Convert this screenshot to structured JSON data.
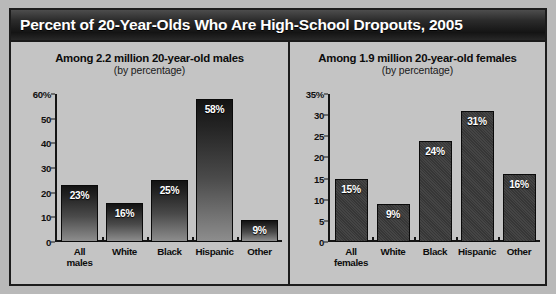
{
  "title": "Percent of 20-Year-Olds Who Are High-School Dropouts, 2005",
  "panels": {
    "male": {
      "title": "Among 2.2 million 20-year-old males",
      "subtitle": "(by percentage)"
    },
    "female": {
      "title": "Among 1.9 million 20-year-old females",
      "subtitle": "(by percentage)"
    }
  },
  "colors": {
    "title_bar": "#1f1f1f",
    "background": "#c4c4c4",
    "border": "#1c1c1c",
    "bar_male": "#2a2a2a",
    "bar_female": "#3b3b3b",
    "label_text": "#ffffff"
  },
  "chart_data": [
    {
      "type": "bar",
      "title": "Among 2.2 million 20-year-old males",
      "subtitle": "(by percentage)",
      "xlabel": "",
      "ylabel": "",
      "ylim": [
        0,
        60
      ],
      "yticks": [
        0,
        10,
        20,
        30,
        40,
        50,
        60
      ],
      "yticklabels": [
        "0",
        "10",
        "20",
        "30",
        "40",
        "50",
        "60%"
      ],
      "grid": false,
      "legend": null,
      "categories": [
        "All males",
        "White",
        "Black",
        "Hispanic",
        "Other"
      ],
      "category_lines": [
        [
          "All",
          "males"
        ],
        [
          "White"
        ],
        [
          "Black"
        ],
        [
          "Hispanic"
        ],
        [
          "Other"
        ]
      ],
      "values": [
        23,
        16,
        25,
        58,
        9
      ],
      "datalabels": [
        "23%",
        "16%",
        "25%",
        "58%",
        "9%"
      ]
    },
    {
      "type": "bar",
      "title": "Among 1.9 million 20-year-old females",
      "subtitle": "(by percentage)",
      "xlabel": "",
      "ylabel": "",
      "ylim": [
        0,
        35
      ],
      "yticks": [
        0,
        5,
        10,
        15,
        20,
        25,
        30,
        35
      ],
      "yticklabels": [
        "0",
        "5",
        "10",
        "15",
        "20",
        "25",
        "30",
        "35%"
      ],
      "grid": false,
      "legend": null,
      "categories": [
        "All females",
        "White",
        "Black",
        "Hispanic",
        "Other"
      ],
      "category_lines": [
        [
          "All",
          "females"
        ],
        [
          "White"
        ],
        [
          "Black"
        ],
        [
          "Hispanic"
        ],
        [
          "Other"
        ]
      ],
      "values": [
        15,
        9,
        24,
        31,
        16
      ],
      "datalabels": [
        "15%",
        "9%",
        "24%",
        "31%",
        "16%"
      ]
    }
  ]
}
